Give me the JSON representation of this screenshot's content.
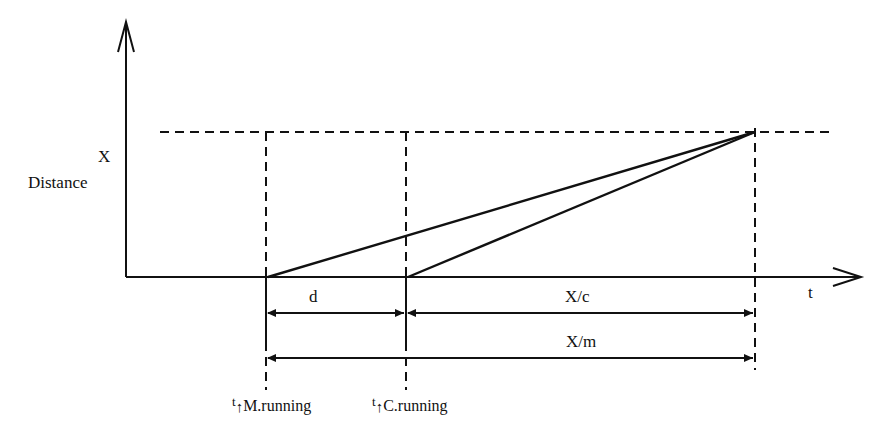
{
  "diagram": {
    "y_axis_label": "Distance",
    "y_marker_label": "X",
    "x_axis_label": "t",
    "dimensions": {
      "d": "d",
      "x_over_c": "X/c",
      "x_over_m": "X/m"
    },
    "time_markers": [
      {
        "t": "t",
        "subscript": "M.running"
      },
      {
        "t": "t",
        "subscript": "C.running"
      }
    ],
    "colors": {
      "line": "#111111",
      "background": "#ffffff"
    }
  }
}
